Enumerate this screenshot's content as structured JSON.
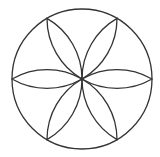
{
  "diagram": {
    "type": "hexafoil-rosette",
    "stroke_color": "#333333",
    "background": "#ffffff",
    "outer_circle": {
      "cx": 82,
      "cy": 79,
      "r": 70
    },
    "petal_count": 6
  }
}
